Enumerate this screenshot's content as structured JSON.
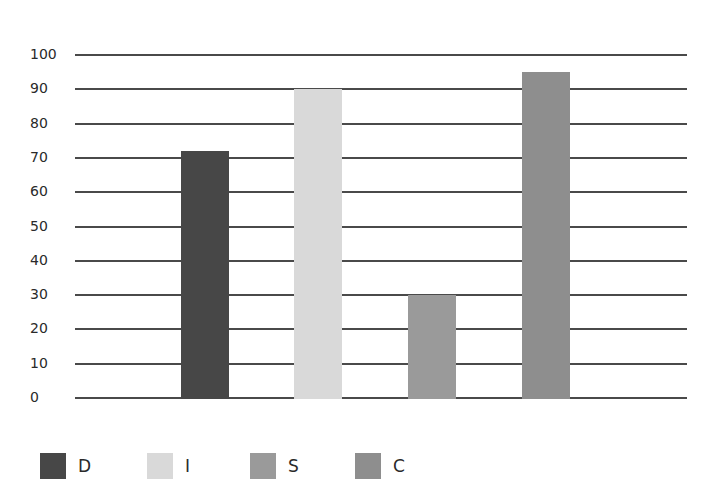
{
  "chart_data": {
    "type": "bar",
    "title": "",
    "xlabel": "",
    "ylabel": "",
    "categories": [
      "D",
      "I",
      "S",
      "C"
    ],
    "values": [
      72,
      90,
      30,
      95
    ],
    "colors": [
      "#474747",
      "#d9d9d9",
      "#9a9a9a",
      "#8e8e8e"
    ],
    "ylim": [
      0,
      100
    ],
    "yticks": [
      0,
      10,
      20,
      30,
      40,
      50,
      60,
      70,
      80,
      90,
      100
    ],
    "grid": true,
    "legend_position": "bottom-left",
    "legend": [
      {
        "label": "D",
        "color": "#474747"
      },
      {
        "label": "I",
        "color": "#d9d9d9"
      },
      {
        "label": "S",
        "color": "#9a9a9a"
      },
      {
        "label": "C",
        "color": "#8e8e8e"
      }
    ]
  }
}
